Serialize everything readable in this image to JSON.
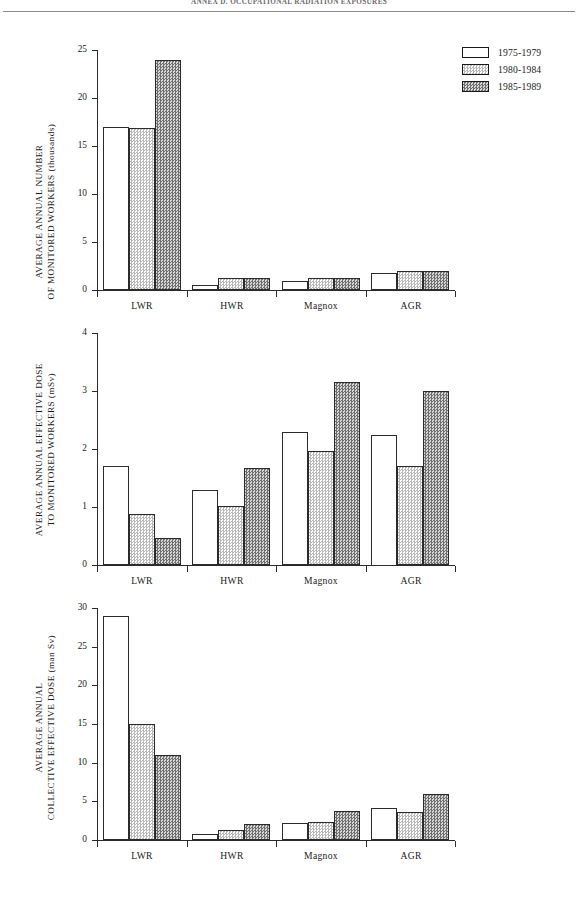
{
  "page": {
    "running_head": "ANNEX D. OCCUPATIONAL RADIATION EXPOSURES"
  },
  "legend": {
    "items": [
      {
        "label": "1975-1979",
        "pattern": "solid-white"
      },
      {
        "label": "1980-1984",
        "pattern": "light-stipple"
      },
      {
        "label": "1985-1989",
        "pattern": "dark-stipple"
      }
    ]
  },
  "colors": {
    "ink": "#1a1a1a",
    "axis": "#2b2b2b",
    "series_1_fill": "#ffffff",
    "series_2_fill": "#b9b9b9",
    "series_3_fill": "#6f6f6f"
  },
  "chart_data": [
    {
      "id": "monitored-workers",
      "type": "bar",
      "title": "",
      "xlabel": "",
      "ylabel": "AVERAGE ANNUAL NUMBER\nOF MONITORED WORKERS (thousands)",
      "ylabel_line1": "AVERAGE ANNUAL NUMBER",
      "ylabel_line2": "OF MONITORED WORKERS (thousands)",
      "categories": [
        "LWR",
        "HWR",
        "Magnox",
        "AGR"
      ],
      "yticks": [
        0,
        5,
        10,
        15,
        20,
        25
      ],
      "ytick_labels": [
        "0",
        "5",
        "10",
        "15",
        "20",
        "25"
      ],
      "ylim": [
        0,
        25
      ],
      "grid": false,
      "legend_position": "top-right",
      "series": [
        {
          "name": "1975-1979",
          "values": [
            17.0,
            0.5,
            0.9,
            1.8
          ]
        },
        {
          "name": "1980-1984",
          "values": [
            16.9,
            1.2,
            1.2,
            2.0
          ]
        },
        {
          "name": "1985-1989",
          "values": [
            24.0,
            1.2,
            1.2,
            2.0
          ]
        }
      ]
    },
    {
      "id": "effective-dose",
      "type": "bar",
      "title": "",
      "xlabel": "",
      "ylabel": "AVERAGE ANNUAL EFFECTIVE DOSE\nTO MONITORED WORKERS (mSv)",
      "ylabel_line1": "AVERAGE ANNUAL EFFECTIVE DOSE",
      "ylabel_line2": "TO MONITORED WORKERS (mSv)",
      "categories": [
        "LWR",
        "HWR",
        "Magnox",
        "AGR"
      ],
      "yticks": [
        0,
        1,
        2,
        3,
        4
      ],
      "ytick_labels": [
        "0",
        "1",
        "2",
        "3",
        "4"
      ],
      "ylim": [
        0,
        4
      ],
      "grid": false,
      "legend_position": "none",
      "series": [
        {
          "name": "1975-1979",
          "values": [
            1.7,
            1.29,
            2.3,
            2.25
          ]
        },
        {
          "name": "1980-1984",
          "values": [
            0.88,
            1.02,
            1.97,
            1.7
          ]
        },
        {
          "name": "1985-1989",
          "values": [
            0.46,
            1.68,
            3.15,
            3.0
          ]
        }
      ]
    },
    {
      "id": "collective-dose",
      "type": "bar",
      "title": "",
      "xlabel": "",
      "ylabel": "AVERAGE ANNUAL\nCOLLECTIVE EFFECTIVE DOSE (man Sv)",
      "ylabel_line1": "AVERAGE ANNUAL",
      "ylabel_line2": "COLLECTIVE EFFECTIVE DOSE (man Sv)",
      "categories": [
        "LWR",
        "HWR",
        "Magnox",
        "AGR"
      ],
      "yticks": [
        0,
        5,
        10,
        15,
        20,
        25,
        30
      ],
      "ytick_labels": [
        "0",
        "5",
        "10",
        "15",
        "20",
        "25",
        "30"
      ],
      "ylim": [
        0,
        30
      ],
      "grid": false,
      "legend_position": "none",
      "series": [
        {
          "name": "1975-1979",
          "values": [
            29.0,
            0.8,
            2.2,
            4.1
          ]
        },
        {
          "name": "1980-1984",
          "values": [
            15.0,
            1.3,
            2.3,
            3.6
          ]
        },
        {
          "name": "1985-1989",
          "values": [
            11.0,
            2.1,
            3.8,
            5.9
          ]
        }
      ]
    }
  ]
}
